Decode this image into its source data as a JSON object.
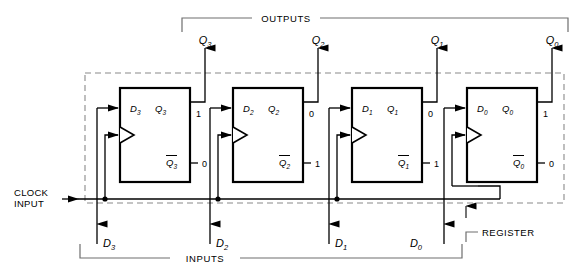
{
  "diagram": {
    "sections": {
      "outputs_label": "OUTPUTS",
      "inputs_label": "INPUTS",
      "register_label": "REGISTER",
      "clock_label_line1": "CLOCK",
      "clock_label_line2": "INPUT"
    },
    "colors": {
      "line": "#000000",
      "dashed": "#8a8a8a",
      "bracket": "#6e6e6e",
      "background": "#ffffff"
    },
    "stages": [
      {
        "index": 0,
        "d_pin": "D",
        "d_sub": "3",
        "q_pin": "Q",
        "q_sub": "3",
        "qbar_pin": "Q",
        "qbar_sub": "3",
        "q_value": "1",
        "qbar_value": "0",
        "output_label": "Q",
        "output_sub": "3",
        "input_label": "D",
        "input_sub": "3"
      },
      {
        "index": 1,
        "d_pin": "D",
        "d_sub": "2",
        "q_pin": "Q",
        "q_sub": "2",
        "qbar_pin": "Q",
        "qbar_sub": "2",
        "q_value": "0",
        "qbar_value": "1",
        "output_label": "Q",
        "output_sub": "2",
        "input_label": "D",
        "input_sub": "2"
      },
      {
        "index": 2,
        "d_pin": "D",
        "d_sub": "1",
        "q_pin": "Q",
        "q_sub": "1",
        "qbar_pin": "Q",
        "qbar_sub": "1",
        "q_value": "0",
        "qbar_value": "1",
        "output_label": "Q",
        "output_sub": "1",
        "input_label": "D",
        "input_sub": "1"
      },
      {
        "index": 3,
        "d_pin": "D",
        "d_sub": "0",
        "q_pin": "Q",
        "q_sub": "0",
        "qbar_pin": "Q",
        "qbar_sub": "0",
        "q_value": "1",
        "qbar_value": "0",
        "output_label": "Q",
        "output_sub": "0",
        "input_label": "D",
        "input_sub": "0"
      }
    ]
  }
}
